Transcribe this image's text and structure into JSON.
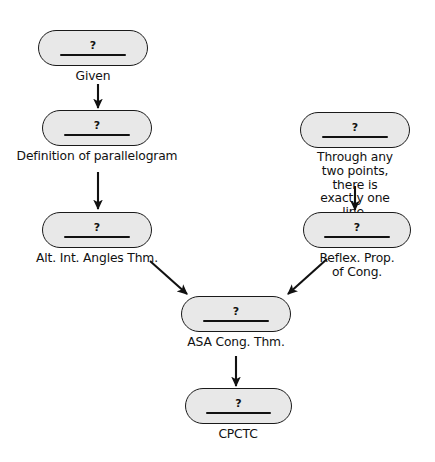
{
  "diagram": {
    "background_color": "#ffffff",
    "node_fill_color": "#e8e8e8",
    "node_border_color": "#1a1a1a",
    "text_color": "#111111",
    "blank_symbol": "?"
  },
  "nodes": [
    {
      "id": "given",
      "blank": "?",
      "caption": "Given"
    },
    {
      "id": "def-parallelogram",
      "blank": "?",
      "caption": "Definition of parallelogram"
    },
    {
      "id": "alt-int-angles",
      "blank": "?",
      "caption": "Alt. Int. Angles Thm."
    },
    {
      "id": "two-points-line",
      "blank": "?",
      "caption": "Through any two points,\nthere is exactly one line."
    },
    {
      "id": "reflex-prop",
      "blank": "?",
      "caption": "Reflex. Prop. of Cong."
    },
    {
      "id": "asa-cong",
      "blank": "?",
      "caption": "ASA Cong. Thm."
    },
    {
      "id": "cpctc",
      "blank": "?",
      "caption": "CPCTC"
    }
  ],
  "edges": [
    {
      "id": "given-to-def",
      "from": "given",
      "to": "def-parallelogram",
      "kind": "vertical"
    },
    {
      "id": "def-to-alt",
      "from": "def-parallelogram",
      "to": "alt-int-angles",
      "kind": "vertical"
    },
    {
      "id": "points-to-reflex",
      "from": "two-points-line",
      "to": "reflex-prop",
      "kind": "vertical"
    },
    {
      "id": "alt-to-asa",
      "from": "alt-int-angles",
      "to": "asa-cong",
      "kind": "diagonal-right-down"
    },
    {
      "id": "reflex-to-asa",
      "from": "reflex-prop",
      "to": "asa-cong",
      "kind": "diagonal-left-down"
    },
    {
      "id": "asa-to-cpctc",
      "from": "asa-cong",
      "to": "cpctc",
      "kind": "vertical"
    }
  ]
}
